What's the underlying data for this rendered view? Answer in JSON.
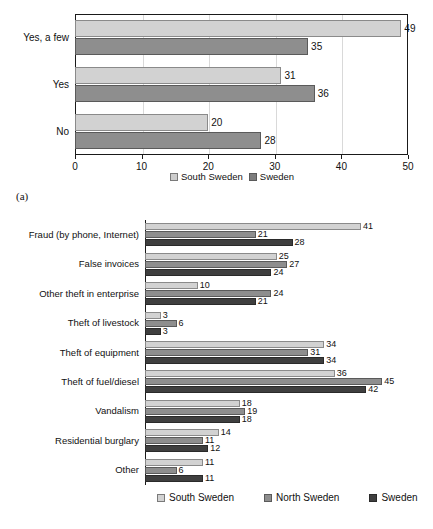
{
  "panels": {
    "a_label": "(a)",
    "b_label": "(b)"
  },
  "chart_data": [
    {
      "id": "a",
      "type": "bar",
      "orientation": "horizontal",
      "title": "",
      "xlabel": "",
      "ylabel": "",
      "categories": [
        "Yes, a few",
        "Yes",
        "No"
      ],
      "series": [
        {
          "name": "South Sweden",
          "color": "#cdcdcd",
          "values": [
            49,
            31,
            20
          ]
        },
        {
          "name": "Sweden",
          "color": "#7d7d7d",
          "values": [
            35,
            36,
            28
          ]
        }
      ],
      "xlim": [
        0,
        50
      ],
      "xticks": [
        0,
        10,
        20,
        30,
        40,
        50
      ],
      "xtick_labels": [
        "0",
        "10",
        "20",
        "30",
        "40",
        "50"
      ],
      "grid": true,
      "legend_position": "bottom"
    },
    {
      "id": "b",
      "type": "bar",
      "orientation": "horizontal",
      "title": "",
      "xlabel": "",
      "ylabel": "",
      "categories": [
        "Fraud (by phone, Internet)",
        "False invoices",
        "Other theft in enterprise",
        "Theft of livestock",
        "Theft of equipment",
        "Theft of fuel/diesel",
        "Vandalism",
        "Residential burglary",
        "Other"
      ],
      "series": [
        {
          "name": "South Sweden",
          "color": "#d2d2d2",
          "values": [
            41,
            25,
            10,
            3,
            34,
            36,
            18,
            14,
            11
          ]
        },
        {
          "name": "North Sweden",
          "color": "#8e8e8e",
          "values": [
            21,
            27,
            24,
            6,
            31,
            45,
            19,
            11,
            6
          ]
        },
        {
          "name": "Sweden",
          "color": "#3f3f3f",
          "values": [
            28,
            24,
            21,
            3,
            34,
            42,
            18,
            12,
            11
          ]
        }
      ],
      "xlim": [
        0,
        50
      ],
      "xticks": [],
      "xtick_labels": [],
      "grid": false,
      "legend_position": "bottom"
    }
  ]
}
